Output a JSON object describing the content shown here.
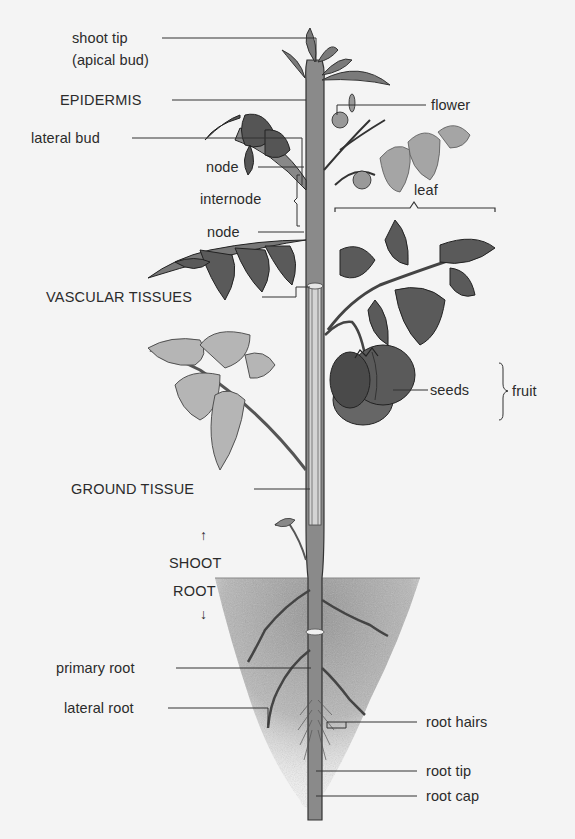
{
  "diagram": {
    "background": "#f4f4f4",
    "soil_color": "#9a9a9a",
    "labels": {
      "shoot_tip": "shoot tip",
      "apical_bud": "(apical bud)",
      "epidermis": "EPIDERMIS",
      "lateral_bud": "lateral bud",
      "node_upper": "node",
      "internode": "internode",
      "node_lower": "node",
      "flower": "flower",
      "leaf": "leaf",
      "vascular_tissues": "VASCULAR TISSUES",
      "seeds": "seeds",
      "fruit": "fruit",
      "ground_tissue": "GROUND TISSUE",
      "shoot": "SHOOT",
      "root": "ROOT",
      "primary_root": "primary root",
      "lateral_root": "lateral root",
      "root_hairs": "root hairs",
      "root_tip": "root tip",
      "root_cap": "root cap"
    },
    "arrows": {
      "up": "↑",
      "down": "↓"
    }
  }
}
